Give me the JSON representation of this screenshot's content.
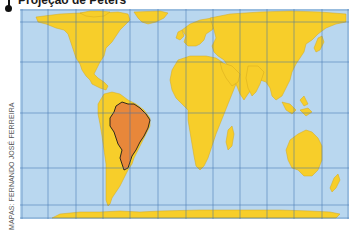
{
  "map": {
    "title": "Projeção de Peters",
    "credit": "MAPAS: FERNANDO JOSÉ FERREIRA",
    "projection": "Peters (equal-area)",
    "highlighted_country": "Brasil",
    "colors": {
      "ocean": "#b9d7ef",
      "land": "#f7ce2a",
      "highlight": "#e8873a",
      "grid": "#3a6fae",
      "border": "#1a1a1a",
      "coast": "#c9a21a"
    },
    "graticule": {
      "meridians_x_px": [
        22,
        48,
        76,
        103,
        130,
        158,
        186,
        213,
        240,
        267,
        294,
        322,
        348
      ],
      "parallels_y_px": [
        10,
        22,
        62,
        113,
        168,
        205,
        218
      ]
    }
  }
}
